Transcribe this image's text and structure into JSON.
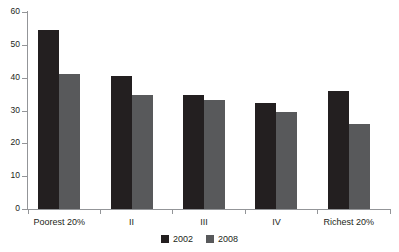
{
  "chart_data": {
    "type": "bar",
    "title": "",
    "subtitle": "",
    "xlabel": "",
    "ylabel": "",
    "categories": [
      "Poorest 20%",
      "II",
      "III",
      "IV",
      "Richest 20%"
    ],
    "series": [
      {
        "name": "2002",
        "color": "#231f20",
        "values": [
          54.5,
          40.5,
          34.7,
          32.3,
          36.0
        ]
      },
      {
        "name": "2008",
        "color": "#58595b",
        "values": [
          41.0,
          34.7,
          33.2,
          29.5,
          26.0
        ]
      }
    ],
    "ylim": [
      0,
      60
    ],
    "ytick_values": [
      0,
      10,
      20,
      30,
      40,
      50,
      60
    ],
    "ytick_labels": [
      "0",
      "10",
      "20",
      "30",
      "40",
      "50",
      "60"
    ],
    "grid": false,
    "legend_position": "bottom",
    "annotations": []
  },
  "legend": {
    "entries": [
      {
        "label": "2002",
        "swatch": "legend-swatch-2002"
      },
      {
        "label": "2008",
        "swatch": "legend-swatch-2008"
      }
    ]
  },
  "axes": {
    "y_axis_name": "y-axis",
    "x_axis_name": "x-axis"
  }
}
